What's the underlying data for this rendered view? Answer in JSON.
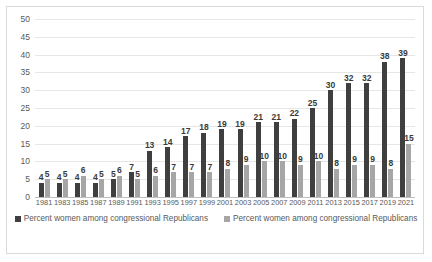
{
  "chart_data": {
    "type": "bar",
    "title": "",
    "xlabel": "",
    "ylabel": "",
    "ylim": [
      0,
      50
    ],
    "y_ticks": [
      50,
      45,
      40,
      35,
      30,
      25,
      20,
      15,
      10,
      5,
      0
    ],
    "grid": true,
    "legend_position": "bottom",
    "categories": [
      "1981",
      "1983",
      "1985",
      "1987",
      "1989",
      "1991",
      "1993",
      "1995",
      "1997",
      "1999",
      "2001",
      "2003",
      "2005",
      "2007",
      "2009",
      "2011",
      "2013",
      "2015",
      "2017",
      "2019",
      "2021"
    ],
    "series": [
      {
        "name": "Percent women among congressional Republicans",
        "color": "#3f3f3f",
        "values": [
          4,
          4,
          4,
          4,
          5,
          7,
          13,
          14,
          17,
          18,
          19,
          19,
          21,
          21,
          22,
          25,
          30,
          32,
          32,
          38,
          39
        ]
      },
      {
        "name": "Percent women among congressional Republicans",
        "color": "#a6a6a6",
        "values": [
          5,
          5,
          6,
          5,
          6,
          5,
          6,
          7,
          7,
          7,
          8,
          9,
          10,
          10,
          9,
          10,
          8,
          9,
          9,
          8,
          15
        ]
      }
    ]
  },
  "colors": {
    "series_a": "#3f3f3f",
    "series_b": "#a6a6a6",
    "gridline": "#e6e6e6",
    "axis": "#bfbfbf",
    "text": "#595959",
    "border": "#d9d9d9",
    "background": "#ffffff"
  }
}
